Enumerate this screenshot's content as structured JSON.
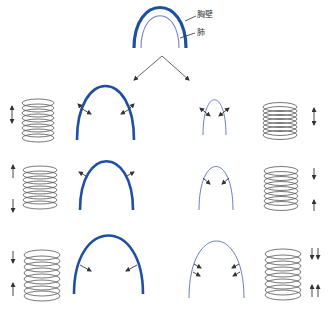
{
  "diagram": {
    "labels": {
      "chest_wall": "胸壁",
      "lung": "肺"
    },
    "colors": {
      "chest_wall": "#1f4fa3",
      "lung": "#6a7fc0",
      "coil": "#555555",
      "arrow": "#333333",
      "branch": "#555555"
    },
    "rows": [
      {
        "name": "row-1",
        "left_coil": "spring-neutral",
        "left_arrows": "double-vertical",
        "chest_wall_arrows": "outward-and-inward",
        "lung_arrows": "outward-and-inward",
        "right_coil": "spring-compressed",
        "right_arrows": "double-vertical"
      },
      {
        "name": "row-2",
        "left_coil": "spring-stretched",
        "left_arrows": "apart",
        "chest_wall_arrows": "outward",
        "lung_arrows": "inward",
        "right_coil": "spring-stretched",
        "right_arrows": "together"
      },
      {
        "name": "row-3",
        "left_coil": "spring-extended",
        "left_arrows": "together",
        "chest_wall_arrows": "inward",
        "lung_arrows": "double-inward",
        "right_coil": "spring-extended",
        "right_arrows": "double-together"
      }
    ]
  }
}
